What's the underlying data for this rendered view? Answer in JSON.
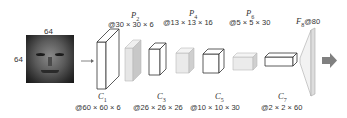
{
  "input": {
    "width_label": "64",
    "height_label": "64",
    "image": "grayscale-face"
  },
  "layers": [
    {
      "id": "C1",
      "name": "C",
      "sub": "1",
      "dims": "@60 × 60 × 6"
    },
    {
      "id": "P2",
      "name": "P",
      "sub": "2",
      "dims": "@30 × 30 × 6"
    },
    {
      "id": "C3",
      "name": "C",
      "sub": "3",
      "dims": "@26 × 26 × 26"
    },
    {
      "id": "P4",
      "name": "P",
      "sub": "4",
      "dims": "@13 × 13 × 16"
    },
    {
      "id": "C5",
      "name": "C",
      "sub": "5",
      "dims": "@10 × 10 × 30"
    },
    {
      "id": "P6",
      "name": "P",
      "sub": "6",
      "dims": "@5 × 5 × 30"
    },
    {
      "id": "C7",
      "name": "C",
      "sub": "7",
      "dims": "@2 × 2 × 60"
    },
    {
      "id": "F8",
      "name": "F",
      "sub": "8",
      "dims": "@80"
    }
  ],
  "colors": {
    "outline": "#333333",
    "pool_fill": "#e6e6e6",
    "pool_side": "#c8c8c8",
    "fc_fill": "#f2f2f2",
    "output_arrow": "#808080",
    "small_arrow": "#666666"
  },
  "arrows": {
    "input_arrow": "→",
    "output_arrow": "➡"
  }
}
